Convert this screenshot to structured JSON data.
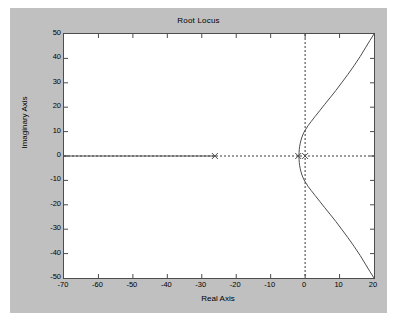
{
  "figure": {
    "title": "Root Locus",
    "background_color": "#c0c0c0",
    "axes_background_color": "#ffffff",
    "axes_border_color": "#4d4d4d"
  },
  "axis": {
    "xlabel": "Real Axis",
    "ylabel": "Imaginary Axis",
    "xticks": [
      "-70",
      "-60",
      "-50",
      "-40",
      "-30",
      "-20",
      "-10",
      "0",
      "10",
      "20"
    ],
    "yticks": [
      "50",
      "40",
      "30",
      "20",
      "10",
      "0",
      "-10",
      "-20",
      "-30",
      "-40",
      "-50"
    ],
    "xlim": [
      -70,
      20
    ],
    "ylim": [
      -50,
      50
    ]
  },
  "chart_data": {
    "type": "line",
    "title": "Root Locus",
    "xlabel": "Real Axis",
    "ylabel": "Imaginary Axis",
    "xlim": [
      -70,
      20
    ],
    "ylim": [
      -50,
      50
    ],
    "xticks": [
      -70,
      -60,
      -50,
      -40,
      -30,
      -20,
      -10,
      0,
      10,
      20
    ],
    "yticks": [
      -50,
      -40,
      -30,
      -20,
      -10,
      0,
      10,
      20,
      30,
      40,
      50
    ],
    "grid": false,
    "legend": false,
    "line_color": "#4d4d4d",
    "marker_color": "#4d4d4d",
    "dashed_axis_color": "#3a3a3a",
    "poles": [
      {
        "label": "pole-1",
        "x": -26.2,
        "y": 0,
        "marker": "x"
      },
      {
        "label": "pole-2",
        "x": -2.0,
        "y": 0,
        "marker": "x"
      },
      {
        "label": "pole-3",
        "x": 0.0,
        "y": 0,
        "marker": "x"
      }
    ],
    "breakaway_point": {
      "x": -1.8,
      "y": 0
    },
    "reference_lines": [
      {
        "name": "real-axis",
        "orientation": "horizontal",
        "value": 0,
        "style": "dashed"
      },
      {
        "name": "imaginary-axis",
        "orientation": "vertical",
        "value": 0,
        "style": "dashed"
      }
    ],
    "series": [
      {
        "name": "real-axis-branch-left",
        "points": [
          [
            -70,
            0
          ],
          [
            -26.2,
            0
          ]
        ]
      },
      {
        "name": "real-axis-branch-center",
        "points": [
          [
            -2.0,
            0
          ],
          [
            -1.8,
            0
          ]
        ]
      },
      {
        "name": "complex-branch-upper",
        "points": [
          [
            -1.8,
            0.0
          ],
          [
            -1.75,
            1.4
          ],
          [
            -1.7,
            2.6
          ],
          [
            -1.6,
            3.8
          ],
          [
            -1.45,
            5.0
          ],
          [
            -1.25,
            6.2
          ],
          [
            -1.0,
            7.4
          ],
          [
            -0.7,
            8.6
          ],
          [
            -0.3,
            9.8
          ],
          [
            0.2,
            11.0
          ],
          [
            0.9,
            12.5
          ],
          [
            1.8,
            14.2
          ],
          [
            2.9,
            16.2
          ],
          [
            4.2,
            18.5
          ],
          [
            5.6,
            21.0
          ],
          [
            7.2,
            23.8
          ],
          [
            8.9,
            26.8
          ],
          [
            10.6,
            30.0
          ],
          [
            12.4,
            33.4
          ],
          [
            14.2,
            37.0
          ],
          [
            16.0,
            40.8
          ],
          [
            17.5,
            44.3
          ],
          [
            18.8,
            47.3
          ],
          [
            20.0,
            50.0
          ]
        ]
      },
      {
        "name": "complex-branch-lower",
        "points": [
          [
            -1.8,
            0.0
          ],
          [
            -1.75,
            -1.4
          ],
          [
            -1.7,
            -2.6
          ],
          [
            -1.6,
            -3.8
          ],
          [
            -1.45,
            -5.0
          ],
          [
            -1.25,
            -6.2
          ],
          [
            -1.0,
            -7.4
          ],
          [
            -0.7,
            -8.6
          ],
          [
            -0.3,
            -9.8
          ],
          [
            0.2,
            -11.0
          ],
          [
            0.9,
            -12.5
          ],
          [
            1.8,
            -14.2
          ],
          [
            2.9,
            -16.2
          ],
          [
            4.2,
            -18.5
          ],
          [
            5.6,
            -21.0
          ],
          [
            7.2,
            -23.8
          ],
          [
            8.9,
            -26.8
          ],
          [
            10.6,
            -30.0
          ],
          [
            12.4,
            -33.4
          ],
          [
            14.2,
            -37.0
          ],
          [
            16.0,
            -40.8
          ],
          [
            17.5,
            -44.3
          ],
          [
            18.8,
            -47.3
          ],
          [
            20.0,
            -50.0
          ]
        ]
      }
    ]
  }
}
